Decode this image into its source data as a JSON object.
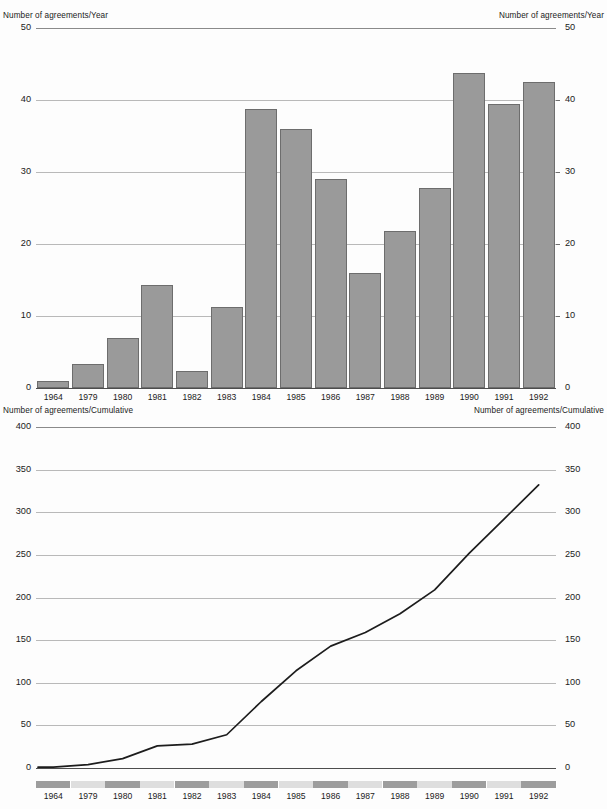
{
  "figure": {
    "years": [
      "1964",
      "1979",
      "1980",
      "1981",
      "1982",
      "1983",
      "1984",
      "1985",
      "1986",
      "1987",
      "1988",
      "1989",
      "1990",
      "1991",
      "1992"
    ],
    "colors": {
      "bar_fill": "#9a9a9a",
      "bar_stroke": "#6d6d6d",
      "gridline": "#b9b9b9",
      "line": "#1d1d1d",
      "band_dark": "#9d9d9d",
      "band_light": "#dedede",
      "background": "#fdfdfd"
    }
  },
  "top_chart": {
    "axis_title_left": "Number of agreements/Year",
    "axis_title_right": "Number of agreements/Year",
    "ticks": [
      "50",
      "40",
      "30",
      "20",
      "10",
      "0"
    ]
  },
  "bottom_chart": {
    "axis_title_left": "Number of agreements/Cumulative",
    "axis_title_right": "Number of agreements/Cumulative",
    "ticks": [
      "400",
      "350",
      "300",
      "250",
      "200",
      "150",
      "100",
      "50",
      "0"
    ]
  },
  "chart_data": [
    {
      "type": "bar",
      "title": "Number of agreements per year",
      "xlabel": "",
      "ylabel": "Number of agreements/Year",
      "ylim": [
        0,
        50
      ],
      "yticks": [
        0,
        10,
        20,
        30,
        40,
        50
      ],
      "grid": true,
      "legend": "none",
      "categories": [
        "1964",
        "1979",
        "1980",
        "1981",
        "1982",
        "1983",
        "1984",
        "1985",
        "1986",
        "1987",
        "1988",
        "1989",
        "1990",
        "1991",
        "1992"
      ],
      "values": [
        1,
        3.3,
        7,
        14.3,
        2.3,
        11.2,
        38.8,
        36,
        29,
        16,
        21.8,
        27.8,
        43.7,
        39.5,
        42.5
      ]
    },
    {
      "type": "line",
      "title": "Cumulative number of agreements",
      "xlabel": "",
      "ylabel": "Number of agreements/Cumulative",
      "ylim": [
        0,
        400
      ],
      "yticks": [
        0,
        50,
        100,
        150,
        200,
        250,
        300,
        350,
        400
      ],
      "grid": true,
      "legend": "none",
      "x": [
        "1964",
        "1979",
        "1980",
        "1981",
        "1982",
        "1983",
        "1984",
        "1985",
        "1986",
        "1987",
        "1988",
        "1989",
        "1990",
        "1991",
        "1992"
      ],
      "values": [
        1,
        4,
        11,
        26,
        28,
        39,
        78,
        114,
        143,
        159,
        181,
        209,
        252,
        292,
        332
      ]
    }
  ]
}
